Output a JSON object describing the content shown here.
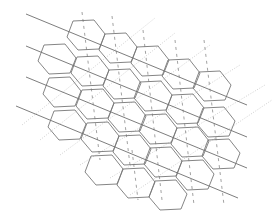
{
  "diagram": {
    "type": "hexagonal-lattice",
    "colors": {
      "hex_stroke": "#777777",
      "solid_line": "#6e6e6e",
      "dashed_line": "#8a8a8a",
      "dotted_line": "#c4c4c4",
      "background": "#ffffff"
    },
    "hex_template": [
      [
        -13,
        -15
      ],
      [
        8,
        -16
      ],
      [
        19,
        -2
      ],
      [
        13,
        13
      ],
      [
        -8,
        14
      ],
      [
        -19,
        1
      ]
    ],
    "hex_centers": [
      [
        86,
        36
      ],
      [
        118,
        49
      ],
      [
        150,
        62
      ],
      [
        181,
        75
      ],
      [
        212,
        87
      ],
      [
        57,
        60
      ],
      [
        90,
        72
      ],
      [
        122,
        85
      ],
      [
        153,
        97
      ],
      [
        185,
        110
      ],
      [
        216,
        123
      ],
      [
        62,
        93
      ],
      [
        95,
        105
      ],
      [
        127,
        118
      ],
      [
        158,
        130
      ],
      [
        190,
        143
      ],
      [
        221,
        155
      ],
      [
        67,
        126
      ],
      [
        100,
        138
      ],
      [
        132,
        151
      ],
      [
        163,
        163
      ],
      [
        195,
        176
      ],
      [
        104,
        171
      ],
      [
        136,
        184
      ],
      [
        168,
        196
      ]
    ],
    "solid_lines": [
      [
        [
          26,
          14
        ],
        [
          247,
          105
        ]
      ],
      [
        [
          26,
          46
        ],
        [
          247,
          137
        ]
      ],
      [
        [
          26,
          77
        ],
        [
          247,
          168
        ]
      ],
      [
        [
          16,
          106
        ],
        [
          238,
          198
        ]
      ]
    ],
    "dashed_lines": [
      [
        [
          82,
          12
        ],
        [
          100,
          160
        ]
      ],
      [
        [
          112,
          16
        ],
        [
          130,
          165
        ]
      ],
      [
        [
          143,
          30
        ],
        [
          162,
          200
        ]
      ],
      [
        [
          175,
          40
        ],
        [
          194,
          205
        ]
      ],
      [
        [
          204,
          40
        ],
        [
          224,
          205
        ]
      ],
      [
        [
          132,
          150
        ],
        [
          138,
          200
        ]
      ]
    ],
    "dotted_lines": [
      [
        [
          22,
          125
        ],
        [
          155,
          18
        ]
      ],
      [
        [
          40,
          140
        ],
        [
          175,
          33
        ]
      ],
      [
        [
          60,
          155
        ],
        [
          210,
          45
        ]
      ],
      [
        [
          80,
          165
        ],
        [
          240,
          65
        ]
      ],
      [
        [
          110,
          178
        ],
        [
          265,
          85
        ]
      ],
      [
        [
          130,
          195
        ],
        [
          272,
          100
        ]
      ]
    ]
  }
}
